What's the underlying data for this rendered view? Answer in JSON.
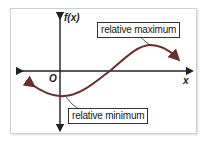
{
  "diagram": {
    "type": "function-graph",
    "axes": {
      "y_label": "f(x)",
      "x_label": "x",
      "origin_label": "O"
    },
    "annotations": {
      "max_label": "relative maximum",
      "min_label": "relative minimum"
    },
    "colors": {
      "curve": "#8a3a3a",
      "axes": "#222222",
      "frame": "#cfcfcf"
    }
  }
}
